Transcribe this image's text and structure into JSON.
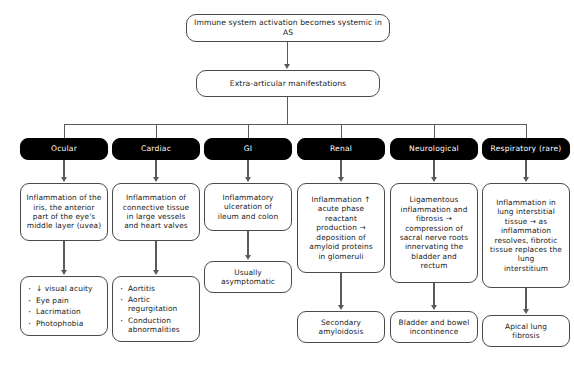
{
  "diagram": {
    "title_node": {
      "label": "Immune system activation becomes systemic in AS"
    },
    "second_node": {
      "label": "Extra-articular manifestations"
    },
    "columns": [
      {
        "key": "ocular",
        "category": "Ocular",
        "detail": "Inflammation of the\niris, the anterior\npart of the eye's\nmiddle layer (uvea)",
        "outcome_type": "bullets",
        "outcome_items": [
          "↓ visual acuity",
          "Eye pain",
          "Lacrimation",
          "Photophobia"
        ]
      },
      {
        "key": "cardiac",
        "category": "Cardiac",
        "detail": "Inflammation of\nconnective tissue\nin large vessels\nand heart valves",
        "outcome_type": "bullets",
        "outcome_items": [
          "Aortitis",
          "Aortic\nregurgitation",
          "Conduction\nabnormalities"
        ]
      },
      {
        "key": "gi",
        "category": "GI",
        "detail": "Inflammatory\nulceration of\nileum and colon",
        "outcome_type": "text",
        "outcome_text": "Usually\nasymptomatic"
      },
      {
        "key": "renal",
        "category": "Renal",
        "detail": "Inflammation ↑\nacute phase\nreactant\nproduction →\ndeposition of\namyloid proteins\nin glomeruli",
        "outcome_type": "text",
        "outcome_text": "Secondary\namyloidosis"
      },
      {
        "key": "neurological",
        "category": "Neurological",
        "detail": "Ligamentous\ninflammation and\nfibrosis →\ncompression of\nsacral nerve roots\ninnervating the\nbladder and\nrectum",
        "outcome_type": "text",
        "outcome_text": "Bladder and bowel\nincontinence"
      },
      {
        "key": "respiratory",
        "category": "Respiratory (rare)",
        "detail": "Inflammation in\nlung interstitial\ntissue → as\ninflammation\nresolves, fibrotic\ntissue replaces the\nlung\ninterstitium",
        "outcome_type": "text",
        "outcome_text": "Apical lung\nfibrosis"
      }
    ],
    "colors": {
      "category_background": "#000000",
      "category_text": "#ffffff",
      "node_border": "#4a4a4a",
      "connector": "#5a5a5a",
      "page_background": "#ffffff"
    }
  }
}
